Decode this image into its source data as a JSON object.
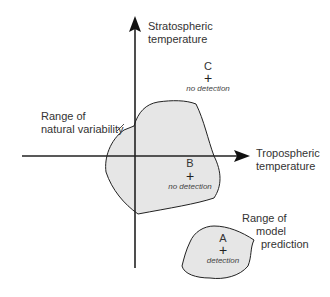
{
  "axes": {
    "y_label_line1": "Stratospheric",
    "y_label_line2": "temperature",
    "x_label_line1": "Tropospheric",
    "x_label_line2": "temperature"
  },
  "regions": {
    "natural": {
      "label_line1": "Range of",
      "label_line2": "natural variability",
      "fill": "#e6e6e6"
    },
    "model": {
      "label_line1": "Range of",
      "label_line2": "model",
      "label_line3": "prediction",
      "fill": "#e6e6e6"
    }
  },
  "points": {
    "A": {
      "letter": "A",
      "marker": "+",
      "note": "detection"
    },
    "B": {
      "letter": "B",
      "marker": "+",
      "note": "no detection"
    },
    "C": {
      "letter": "C",
      "marker": "+",
      "note": "no detection"
    }
  },
  "colors": {
    "stroke": "#222222",
    "region_fill": "#e6e6e6",
    "background": "#ffffff"
  }
}
